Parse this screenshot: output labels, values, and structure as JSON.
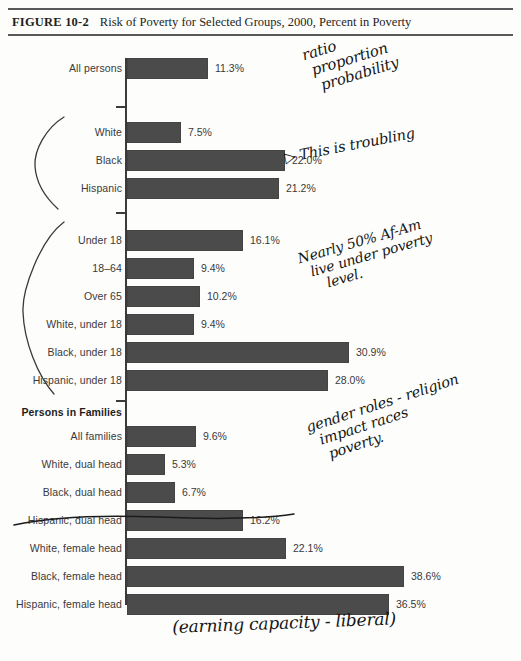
{
  "figure": {
    "number": "FIGURE 10-2",
    "title": "Risk of Poverty for Selected Groups, 2000, Percent in Poverty"
  },
  "chart_data": {
    "type": "bar",
    "orientation": "horizontal",
    "title": "Risk of Poverty for Selected Groups, 2000, Percent in Poverty",
    "xlabel": "",
    "ylabel": "",
    "xlim": [
      0,
      40
    ],
    "grid": false,
    "legend": null,
    "value_suffix": "%",
    "categories": [
      "All persons",
      "White",
      "Black",
      "Hispanic",
      "Under 18",
      "18–64",
      "Over 65",
      "White, under 18",
      "Black, under 18",
      "Hispanic, under 18",
      "All families",
      "White, dual head",
      "Black, dual head",
      "Hispanic, dual head",
      "White, female head",
      "Black, female head",
      "Hispanic, female head"
    ],
    "values": [
      11.3,
      7.5,
      22.0,
      21.2,
      16.1,
      9.4,
      10.2,
      9.4,
      30.9,
      28.0,
      9.6,
      5.3,
      6.7,
      16.2,
      22.1,
      38.6,
      36.5
    ],
    "value_labels": [
      "11.3%",
      "7.5%",
      "22.0%",
      "21.2%",
      "16.1%",
      "9.4%",
      "10.2%",
      "9.4%",
      "30.9%",
      "28.0%",
      "9.6%",
      "5.3%",
      "6.7%",
      "16.2%",
      "22.1%",
      "38.6%",
      "36.5%"
    ],
    "section_headers": [
      "Persons in Families"
    ],
    "bar_color": "#4b4b4b",
    "axis_color": "#3b3b3b"
  },
  "rows": [
    {
      "label": "All persons",
      "value": "11.3%",
      "pct": 11.3,
      "top": 14,
      "head": false
    },
    {
      "label": "White",
      "value": "7.5%",
      "pct": 7.5,
      "top": 78,
      "head": false
    },
    {
      "label": "Black",
      "value": "22.0%",
      "pct": 22.0,
      "top": 106,
      "head": false
    },
    {
      "label": "Hispanic",
      "value": "21.2%",
      "pct": 21.2,
      "top": 134,
      "head": false
    },
    {
      "label": "Under 18",
      "value": "16.1%",
      "pct": 16.1,
      "top": 186,
      "head": false
    },
    {
      "label": "18–64",
      "value": "9.4%",
      "pct": 9.4,
      "top": 214,
      "head": false
    },
    {
      "label": "Over 65",
      "value": "10.2%",
      "pct": 10.2,
      "top": 242,
      "head": false
    },
    {
      "label": "White, under 18",
      "value": "9.4%",
      "pct": 9.4,
      "top": 270,
      "head": false
    },
    {
      "label": "Black, under 18",
      "value": "30.9%",
      "pct": 30.9,
      "top": 298,
      "head": false
    },
    {
      "label": "Hispanic, under 18",
      "value": "28.0%",
      "pct": 28.0,
      "top": 326,
      "head": false
    },
    {
      "label": "Persons in Families",
      "value": "",
      "pct": 0,
      "top": 358,
      "head": true
    },
    {
      "label": "All families",
      "value": "9.6%",
      "pct": 9.6,
      "top": 382,
      "head": false
    },
    {
      "label": "White, dual head",
      "value": "5.3%",
      "pct": 5.3,
      "top": 410,
      "head": false
    },
    {
      "label": "Black, dual head",
      "value": "6.7%",
      "pct": 6.7,
      "top": 438,
      "head": false
    },
    {
      "label": "Hispanic, dual head",
      "value": "16.2%",
      "pct": 16.2,
      "top": 466,
      "head": false
    },
    {
      "label": "White, female head",
      "value": "22.1%",
      "pct": 22.1,
      "top": 494,
      "head": false
    },
    {
      "label": "Black, female head",
      "value": "38.6%",
      "pct": 38.6,
      "top": 522,
      "head": false
    },
    {
      "label": "Hispanic, female head",
      "value": "36.5%",
      "pct": 36.5,
      "top": 550,
      "head": false
    }
  ],
  "annotations": {
    "ratio": "ratio\n proportion\n  probability",
    "troubling": "▷ This is troubling",
    "nearly": "Nearly 50% Af-Am\n  live under poverty\n     level.",
    "gender": "gender roles - religion\n  impact races\n   poverty.",
    "earning": "(earning capacity - liberal)"
  },
  "footer": {
    "faint_text": ""
  }
}
